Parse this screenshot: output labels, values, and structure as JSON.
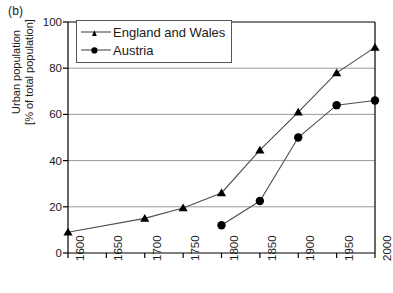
{
  "panel": {
    "label": "(b)"
  },
  "chart_data": {
    "type": "line",
    "title": "",
    "subtitle": "",
    "xlabel": "",
    "ylabel": "Urban population [% of total population]",
    "ylabel_lines": [
      "Urban population",
      "[% of total population]"
    ],
    "x": [
      1600,
      1650,
      1700,
      1750,
      1800,
      1850,
      1900,
      1950,
      2000
    ],
    "xtick_labels": [
      "1600",
      "1650",
      "1700",
      "1750",
      "1800",
      "1850",
      "1900",
      "1950",
      "2000"
    ],
    "ytick_labels": [
      "0",
      "20",
      "40",
      "60",
      "80",
      "100"
    ],
    "yticks": [
      0,
      20,
      40,
      60,
      80,
      100
    ],
    "xlim": [
      1600,
      2000
    ],
    "ylim": [
      0,
      100
    ],
    "grid": "horizontal",
    "legend_position": "top-left-inside",
    "series": [
      {
        "name": "England and Wales",
        "marker": "triangle",
        "color": "#000000",
        "points": [
          {
            "x": 1600,
            "y": 9
          },
          {
            "x": 1700,
            "y": 15
          },
          {
            "x": 1750,
            "y": 19.5
          },
          {
            "x": 1800,
            "y": 26
          },
          {
            "x": 1850,
            "y": 44.5
          },
          {
            "x": 1900,
            "y": 61
          },
          {
            "x": 1950,
            "y": 78
          },
          {
            "x": 2000,
            "y": 89
          }
        ]
      },
      {
        "name": "Austria",
        "marker": "circle",
        "color": "#000000",
        "points": [
          {
            "x": 1800,
            "y": 12
          },
          {
            "x": 1850,
            "y": 22.5
          },
          {
            "x": 1900,
            "y": 50
          },
          {
            "x": 1950,
            "y": 64
          },
          {
            "x": 2000,
            "y": 66
          }
        ]
      }
    ]
  },
  "style": {
    "axis_color": "#000000",
    "grid_color": "#9a9a9a",
    "line_color": "#4d4d4d",
    "marker_color": "#000000",
    "background": "#ffffff"
  }
}
